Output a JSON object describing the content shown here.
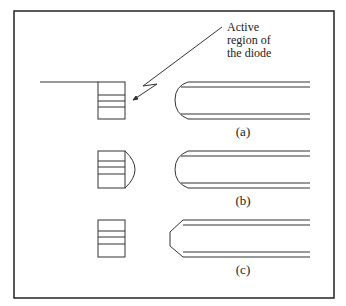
{
  "figure": {
    "annotation": {
      "line1": "Active",
      "line2": "region of",
      "line3": "the diode"
    },
    "panels": [
      {
        "label": "(a)",
        "fiber_tip": "flat-ended with rounded corners",
        "diode_lens": "none"
      },
      {
        "label": "(b)",
        "fiber_tip": "rounded",
        "diode_lens": "hemispherical cap"
      },
      {
        "label": "(c)",
        "fiber_tip": "tapered/chamfered",
        "diode_lens": "none"
      }
    ],
    "colors": {
      "stroke": "#333333",
      "frame": "#222222",
      "background": "#ffffff"
    }
  }
}
